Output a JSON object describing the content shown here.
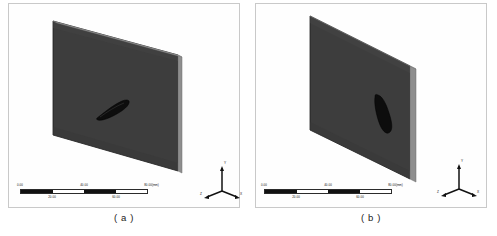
{
  "figure": {
    "type": "cfd-geometry-figure",
    "panels": [
      {
        "id": "a",
        "caption": "( a )",
        "scale_bar": {
          "unit": "(mm)",
          "ticks_top": [
            "0.00",
            "40.00",
            "80.00"
          ],
          "ticks_bottom": [
            "20.00",
            "60.00"
          ],
          "segments": [
            "on",
            "off",
            "on",
            "off"
          ],
          "min": 0.0,
          "max": 80.0
        },
        "axis_triad": {
          "up": "Y",
          "left": "Z",
          "right": "X"
        },
        "body": {
          "name": "airfoil-section",
          "orientation": "inclined",
          "color": "#0d0d0d"
        },
        "slab": {
          "face_color": "#3d3d3d",
          "edge_color": "#8e8e8e",
          "outline_color": "#1c1c1c"
        }
      },
      {
        "id": "b",
        "caption": "( b )",
        "scale_bar": {
          "unit": "(mm)",
          "ticks_top": [
            "0.00",
            "40.00",
            "80.00"
          ],
          "ticks_bottom": [
            "20.00",
            "60.00"
          ],
          "segments": [
            "on",
            "off",
            "on",
            "off"
          ],
          "min": 0.0,
          "max": 80.0
        },
        "axis_triad": {
          "up": "Y",
          "left": "Z",
          "right": "X"
        },
        "body": {
          "name": "airfoil-section",
          "orientation": "vertical",
          "color": "#0d0d0d"
        },
        "slab": {
          "face_color": "#3d3d3d",
          "edge_color": "#8e8e8e",
          "outline_color": "#1c1c1c"
        }
      }
    ],
    "colors": {
      "background": "#ffffff",
      "frame": "#c9c9c9",
      "slab_face": "#3d3d3d",
      "slab_edge": "#8e8e8e",
      "body": "#0d0d0d",
      "text": "#111111"
    }
  }
}
